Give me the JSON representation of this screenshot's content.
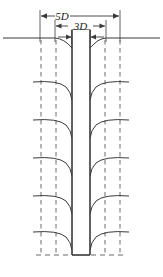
{
  "figure": {
    "type": "engineering-cross-section-diagram",
    "title": "",
    "background_color": "#ffffff",
    "width": 163,
    "height": 277,
    "line_color": "#3a3a3a",
    "dashed_color": "#6b6b6b",
    "label_color": "#1a1a1a"
  },
  "dimensions": [
    {
      "id": "width-5d",
      "label": "5D",
      "x_start": 40,
      "x_end": 120,
      "y": 16,
      "arrow_style": "double-ended-outward",
      "extension_top": 10,
      "extension_bottom": 42
    },
    {
      "id": "width-3d",
      "label": "3D",
      "x_start": 55,
      "x_end": 106,
      "y": 26,
      "arrow_style": "double-ended-outward",
      "extension_top": 20,
      "extension_bottom": 42
    },
    {
      "id": "width-d",
      "label": "D",
      "x_start": 72,
      "x_end": 90,
      "y": 37,
      "arrow_style": "double-ended-inward",
      "boxed": true
    }
  ],
  "shaft": {
    "name": "central-pile-shaft",
    "left_edge_x": 72,
    "right_edge_x": 90,
    "top_y": 30,
    "bottom_y": 255,
    "fill": "#ffffff",
    "stroke_width": 1.6
  },
  "ground_surface": {
    "name": "ground-surface-line",
    "y": 38,
    "x_start": 3,
    "x_end": 160,
    "settlement_trough": true,
    "trough_left_x": 55,
    "trough_right_x": 106,
    "trough_depth": 10
  },
  "base_line": {
    "name": "pile-base-level-line",
    "y": 255,
    "x_start": 36,
    "x_end": 126,
    "style": "dashed"
  },
  "vertical_dashed_lines": [
    {
      "id": "outer-left",
      "x": 41,
      "y_start": 40,
      "y_end": 255,
      "ref": "5D"
    },
    {
      "id": "inner-left",
      "x": 56,
      "y_start": 40,
      "y_end": 255,
      "ref": "3D"
    },
    {
      "id": "inner-right",
      "x": 105,
      "y_start": 40,
      "y_end": 255,
      "ref": "3D"
    },
    {
      "id": "outer-right",
      "x": 120,
      "y_start": 40,
      "y_end": 255,
      "ref": "5D"
    }
  ],
  "shear_curves": {
    "name": "soil-displacement-curves",
    "count_per_side": 5,
    "levels_y": [
      82,
      120,
      158,
      196,
      232
    ],
    "left_outer_x": 33,
    "right_outer_x": 128,
    "description": "curved lines drooping from far field toward the pile shaft"
  },
  "labels": {
    "outer_width": "5D",
    "middle_width": "3D",
    "pile_diameter": "D"
  }
}
